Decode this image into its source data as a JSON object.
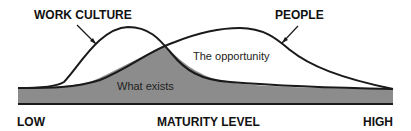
{
  "diagram": {
    "title": "",
    "curves": [
      {
        "name": "WORK CULTURE",
        "shape": "peak-left",
        "peak_x_rel": 0.3
      },
      {
        "name": "PEOPLE",
        "shape": "peak-center",
        "peak_x_rel": 0.59
      }
    ],
    "regions": {
      "shaded": "What exists",
      "unshaded": "The opportunity"
    },
    "axis": {
      "label": "MATURITY LEVEL",
      "low": "LOW",
      "high": "HIGH"
    },
    "colors": {
      "fill": "#8c8c8c",
      "line": "#1a1a1a",
      "background": "#ffffff"
    }
  }
}
